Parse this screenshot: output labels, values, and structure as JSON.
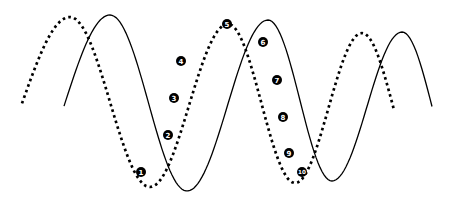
{
  "figure": {
    "kind": "two-phase-shifted-waves",
    "width": 455,
    "height": 209,
    "colors": {
      "background": "#ffffff",
      "ink": "#000000",
      "marker_fill": "#000000",
      "marker_numeral": "#ffffff"
    },
    "curves": {
      "dotted_wave": {
        "style": "dotted",
        "stroke_width": 2.7,
        "dash": [
          2.6,
          3.3
        ],
        "clip_x": [
          22,
          394
        ],
        "extrema": [
          [
            -25,
            187
          ],
          [
            70,
            17
          ],
          [
            150,
            187
          ],
          [
            228,
            24
          ],
          [
            295,
            183
          ],
          [
            362,
            33
          ],
          [
            425,
            183
          ]
        ]
      },
      "solid_wave": {
        "style": "solid",
        "stroke_width": 1.3,
        "clip_x": [
          64,
          432
        ],
        "extrema": [
          [
            20,
            191
          ],
          [
            110,
            15
          ],
          [
            187,
            191
          ],
          [
            268,
            20
          ],
          [
            332,
            181
          ],
          [
            402,
            32
          ],
          [
            462,
            181
          ]
        ]
      }
    },
    "markers": {
      "shape": "filled-circle-white-numeral",
      "radius": 5,
      "items": [
        {
          "label": "1",
          "x": 141,
          "y": 172
        },
        {
          "label": "2",
          "x": 168,
          "y": 135
        },
        {
          "label": "3",
          "x": 174,
          "y": 98
        },
        {
          "label": "4",
          "x": 181,
          "y": 61
        },
        {
          "label": "5",
          "x": 227,
          "y": 24
        },
        {
          "label": "6",
          "x": 263,
          "y": 42
        },
        {
          "label": "7",
          "x": 277,
          "y": 80
        },
        {
          "label": "8",
          "x": 283,
          "y": 117
        },
        {
          "label": "9",
          "x": 289,
          "y": 153
        },
        {
          "label": "10",
          "x": 302,
          "y": 172
        }
      ]
    }
  }
}
